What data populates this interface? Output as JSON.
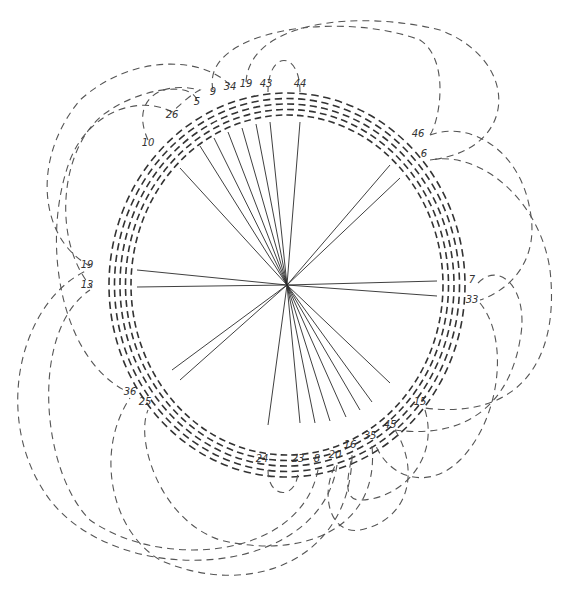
{
  "diagram": {
    "title": "",
    "center": {
      "x": 287,
      "y": 285
    },
    "ring": {
      "rx_outer": 178,
      "ry_outer": 192,
      "band_width": 22,
      "segments": 96,
      "line_count": 5
    },
    "labels": [
      {
        "id": "44",
        "x": 300,
        "y": 87,
        "angle_deg": -86
      },
      {
        "id": "43",
        "x": 266,
        "y": 87,
        "angle_deg": -95
      },
      {
        "id": "19",
        "x": 246,
        "y": 87,
        "angle_deg": -100
      },
      {
        "id": "34",
        "x": 230,
        "y": 90,
        "angle_deg": -105
      },
      {
        "id": "9",
        "x": 213,
        "y": 95,
        "angle_deg": -110
      },
      {
        "id": "5",
        "x": 197,
        "y": 105,
        "angle_deg": -116
      },
      {
        "id": "26",
        "x": 172,
        "y": 118,
        "angle_deg": -123
      },
      {
        "id": "10",
        "x": 148,
        "y": 146,
        "angle_deg": -135
      },
      {
        "id": "46",
        "x": 418,
        "y": 137,
        "angle_deg": -45
      },
      {
        "id": "6",
        "x": 424,
        "y": 157,
        "angle_deg": -40
      },
      {
        "id": "7",
        "x": 472,
        "y": 283,
        "angle_deg": 0
      },
      {
        "id": "33",
        "x": 472,
        "y": 303,
        "angle_deg": 4
      },
      {
        "id": "15",
        "x": 420,
        "y": 405,
        "angle_deg": 45
      },
      {
        "id": "45",
        "x": 390,
        "y": 428,
        "angle_deg": 56
      },
      {
        "id": "35",
        "x": 370,
        "y": 439,
        "angle_deg": 63
      },
      {
        "id": "16",
        "x": 350,
        "y": 448,
        "angle_deg": 68
      },
      {
        "id": "20",
        "x": 335,
        "y": 458,
        "angle_deg": 76
      },
      {
        "id": "8",
        "x": 317,
        "y": 462,
        "angle_deg": 80
      },
      {
        "id": "23",
        "x": 298,
        "y": 462,
        "angle_deg": 85
      },
      {
        "id": "24",
        "x": 262,
        "y": 462,
        "angle_deg": 95
      },
      {
        "id": "25",
        "x": 145,
        "y": 405,
        "angle_deg": 139
      },
      {
        "id": "36",
        "x": 130,
        "y": 395,
        "angle_deg": 143
      },
      {
        "id": "19b",
        "text": "19",
        "x": 87,
        "y": 268,
        "angle_deg": 176
      },
      {
        "id": "13",
        "x": 87,
        "y": 288,
        "angle_deg": 180
      }
    ],
    "rays": [
      {
        "to": "44",
        "x2": 300,
        "y2": 122
      },
      {
        "to": "43",
        "x2": 270,
        "y2": 122
      },
      {
        "to": "19",
        "x2": 256,
        "y2": 124
      },
      {
        "to": "34",
        "x2": 242,
        "y2": 128
      },
      {
        "to": "9",
        "x2": 228,
        "y2": 132
      },
      {
        "to": "5",
        "x2": 214,
        "y2": 138
      },
      {
        "to": "26",
        "x2": 200,
        "y2": 146
      },
      {
        "to": "10",
        "x2": 180,
        "y2": 168
      },
      {
        "to": "46",
        "x2": 390,
        "y2": 165
      },
      {
        "to": "6",
        "x2": 400,
        "y2": 178
      },
      {
        "to": "7",
        "x2": 437,
        "y2": 281
      },
      {
        "to": "33",
        "x2": 437,
        "y2": 296
      },
      {
        "to": "15",
        "x2": 390,
        "y2": 383
      },
      {
        "to": "45",
        "x2": 372,
        "y2": 402
      },
      {
        "to": "35",
        "x2": 360,
        "y2": 410
      },
      {
        "to": "16",
        "x2": 346,
        "y2": 417
      },
      {
        "to": "20",
        "x2": 330,
        "y2": 421
      },
      {
        "to": "8",
        "x2": 315,
        "y2": 423
      },
      {
        "to": "23",
        "x2": 300,
        "y2": 423
      },
      {
        "to": "24",
        "x2": 268,
        "y2": 425
      },
      {
        "to": "25",
        "x2": 180,
        "y2": 380
      },
      {
        "to": "36",
        "x2": 172,
        "y2": 370
      },
      {
        "to": "19b",
        "x2": 137,
        "y2": 270
      },
      {
        "to": "13",
        "x2": 137,
        "y2": 287
      }
    ],
    "loops": [
      {
        "from": "44",
        "to": "43",
        "path": "M300,92 C300,50 268,50 268,92"
      },
      {
        "from": "24",
        "to": "23",
        "path": "M268,470 C268,500 298,500 298,470"
      },
      {
        "from": "10",
        "to": "26",
        "path": "M148,140 C130,100 160,80 200,90 C190,95 180,105 172,112"
      },
      {
        "from": "9",
        "to": "46",
        "path": "M213,90 C200,30 340,10 420,40 C450,60 440,120 430,135"
      },
      {
        "from": "19",
        "to": "6",
        "path": "M246,82 C250,20 360,10 440,30 C520,60 520,150 430,160"
      },
      {
        "from": "34",
        "to": "19b",
        "path": "M230,85 C200,55 130,55 80,100 C30,160 40,240 90,266"
      },
      {
        "from": "26",
        "to": "36",
        "path": "M172,112 C140,95 90,110 70,160 C40,240 60,360 128,392"
      },
      {
        "from": "5",
        "to": "13",
        "path": "M197,100 C190,80 140,90 110,110 C60,140 50,240 92,288"
      },
      {
        "from": "46",
        "to": "33",
        "path": "M430,135 C470,120 520,150 530,210 C540,260 510,290 480,300"
      },
      {
        "from": "6",
        "to": "15",
        "path": "M430,160 C480,150 540,200 550,270 C560,360 520,420 425,408"
      },
      {
        "from": "7",
        "to": "45",
        "path": "M478,283 C500,260 530,290 520,340 C510,400 470,440 395,430"
      },
      {
        "from": "33",
        "to": "35",
        "path": "M480,303 C510,340 500,420 460,460 C430,490 390,480 375,444"
      },
      {
        "from": "15",
        "to": "16",
        "path": "M425,410 C440,460 400,500 360,500 C340,500 350,470 352,455"
      },
      {
        "from": "45",
        "to": "20",
        "path": "M395,430 C420,470 410,520 360,530 C330,535 320,495 335,466"
      },
      {
        "from": "35",
        "to": "25",
        "path": "M372,446 C380,530 300,560 220,540 C160,520 135,440 148,410"
      },
      {
        "from": "16",
        "to": "36",
        "path": "M352,456 C350,560 250,600 160,560 C110,530 95,450 130,398"
      },
      {
        "from": "8",
        "to": "13",
        "path": "M318,470 C300,560 160,570 90,520 C40,470 30,330 90,290"
      },
      {
        "from": "20",
        "to": "19b",
        "path": "M337,465 C320,580 120,590 50,500 C-10,420 20,300 88,270"
      }
    ]
  }
}
